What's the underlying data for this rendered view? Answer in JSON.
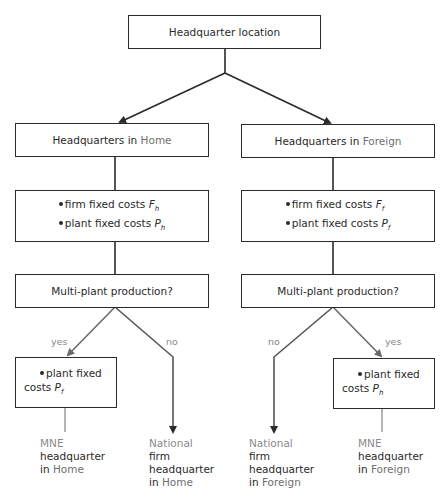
{
  "root": {
    "label": "Headquarter location"
  },
  "branches": {
    "home": {
      "title_prefix": "Headquarters in ",
      "title_place": "Home",
      "costs": [
        {
          "text": "firm fixed costs ",
          "symbol": "F",
          "sub": "h"
        },
        {
          "text": "plant fixed costs ",
          "symbol": "P",
          "sub": "h"
        }
      ],
      "question": "Multi-plant production?",
      "yes_label": "yes",
      "no_label": "no",
      "yes_box": {
        "line1": "plant fixed",
        "line2": "costs ",
        "symbol": "P",
        "sub": "f"
      },
      "yes_outcome": {
        "lead": "MNE",
        "line2": "headquarter",
        "line3_prefix": "in ",
        "line3_place": "Home"
      },
      "no_outcome": {
        "lead": "National",
        "line2": "firm",
        "line3": "headquarter",
        "line4_prefix": "in ",
        "line4_place": "Home"
      }
    },
    "foreign": {
      "title_prefix": "Headquarters in ",
      "title_place": "Foreign",
      "costs": [
        {
          "text": "firm fixed costs ",
          "symbol": "F",
          "sub": "f"
        },
        {
          "text": "plant fixed costs ",
          "symbol": "P",
          "sub": "f"
        }
      ],
      "question": "Multi-plant production?",
      "yes_label": "yes",
      "no_label": "no",
      "yes_box": {
        "line1": "plant fixed",
        "line2": "costs ",
        "symbol": "P",
        "sub": "h"
      },
      "yes_outcome": {
        "lead": "MNE",
        "line2": "headquarter",
        "line3_prefix": "in ",
        "line3_place": "Foreign"
      },
      "no_outcome": {
        "lead": "National",
        "line2": "firm",
        "line3": "headquarter",
        "line4_prefix": "in ",
        "line4_place": "Foreign"
      }
    }
  },
  "colors": {
    "line": "#2a2a2a",
    "branch_line": "#6a6a6a",
    "muted_text": "#8a8a8a"
  }
}
